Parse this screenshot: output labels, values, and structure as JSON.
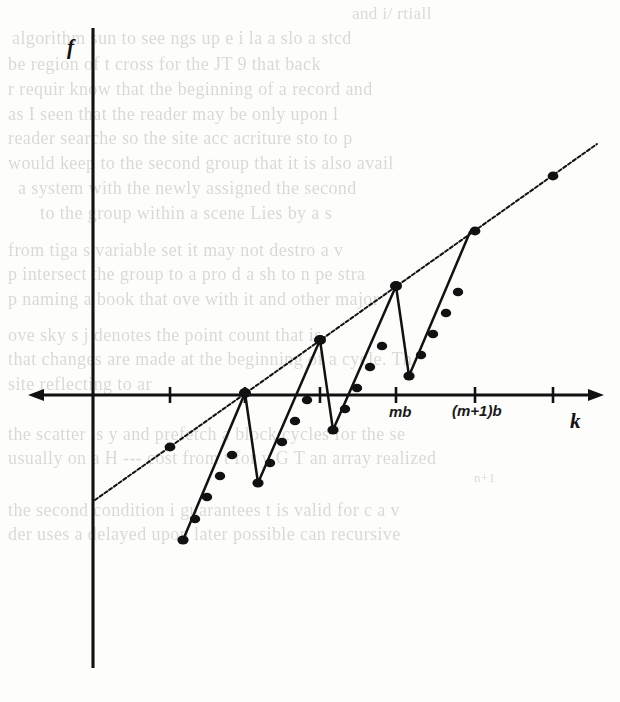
{
  "figure": {
    "kind": "line-plot-with-sawtooth",
    "axes": {
      "y_axis_label": "f",
      "x_axis_label": "k",
      "y_axis_name": "f-axis",
      "x_axis_name": "k-axis"
    },
    "tick_labels": [
      {
        "name": "tick-label-mb",
        "text": "mb"
      },
      {
        "name": "tick-label-m-plus-1-b",
        "text": "(m+1)b"
      }
    ],
    "colors": {
      "ink": "#111111",
      "paper": "#fdfdfb",
      "bleed_ink": "#5d5b57"
    }
  },
  "chart_data": {
    "type": "line",
    "title": "",
    "xlabel": "k",
    "ylabel": "f",
    "grid": false,
    "legend": "none",
    "axis_origin_px": {
      "x": 93,
      "y": 395
    },
    "x_tick_positions_px": [
      170,
      245,
      320,
      396,
      475,
      553
    ],
    "x_tick_labels": [
      "",
      "",
      "",
      "mb",
      "(m+1)b",
      ""
    ],
    "series": [
      {
        "name": "upper-envelope-line",
        "description": "straight increasing dotted line crossing the k axis",
        "style": "dotted-with-markers",
        "points_px": [
          [
            95,
            500
          ],
          [
            170,
            447
          ],
          [
            245,
            393
          ],
          [
            320,
            340
          ],
          [
            396,
            286
          ],
          [
            475,
            231
          ],
          [
            553,
            176
          ],
          [
            595,
            146
          ]
        ],
        "marker_points_px": [
          [
            170,
            447
          ],
          [
            245,
            393
          ],
          [
            320,
            340
          ],
          [
            396,
            286
          ],
          [
            475,
            231
          ],
          [
            553,
            176
          ]
        ]
      },
      {
        "name": "sawtooth-path",
        "description": "zigzag: rises along dotted ramp to meet the line, then drops steeply",
        "style": "solid-with-dot-markers",
        "vertices_px": [
          [
            183,
            540
          ],
          [
            245,
            393
          ],
          [
            258,
            483
          ],
          [
            320,
            340
          ],
          [
            333,
            430
          ],
          [
            396,
            286
          ],
          [
            409,
            376
          ],
          [
            470,
            232
          ]
        ],
        "peak_points_px": [
          [
            245,
            393
          ],
          [
            320,
            340
          ],
          [
            396,
            286
          ]
        ],
        "valley_points_px": [
          [
            183,
            540
          ],
          [
            258,
            483
          ],
          [
            333,
            430
          ],
          [
            409,
            376
          ]
        ],
        "ramp_dot_points_px": [
          [
            195,
            519
          ],
          [
            207,
            497
          ],
          [
            220,
            476
          ],
          [
            232,
            455
          ],
          [
            270,
            463
          ],
          [
            282,
            442
          ],
          [
            295,
            421
          ],
          [
            307,
            400
          ],
          [
            345,
            409
          ],
          [
            357,
            388
          ],
          [
            370,
            367
          ],
          [
            382,
            346
          ],
          [
            421,
            355
          ],
          [
            433,
            334
          ],
          [
            446,
            313
          ],
          [
            458,
            292
          ]
        ]
      }
    ]
  },
  "bleed_text": {
    "note": "faint mirrored show-through text from the reverse side of the scanned page",
    "lines": [
      {
        "text": "and i/ rtiall",
        "x": 352,
        "y": 4,
        "size": 17
      },
      {
        "text": "algorithm sun to see  ngs up  e  i  la  a slo  a  stcd",
        "x": 12,
        "y": 28,
        "size": 18
      },
      {
        "text": "be region  of  t  cross  for the    JT 9 that back",
        "x": 8,
        "y": 54,
        "size": 18
      },
      {
        "text": "r  requir  know that the beginning of a record  and",
        "x": 8,
        "y": 79,
        "size": 18
      },
      {
        "text": "as I  seen that  the reader  may  be only  upon  l",
        "x": 8,
        "y": 104,
        "size": 18
      },
      {
        "text": "reader  searche  so the site acc   acriture  sto to p",
        "x": 8,
        "y": 128,
        "size": 18
      },
      {
        "text": "would keep   to  the second group that it is also  avail",
        "x": 8,
        "y": 153,
        "size": 18
      },
      {
        "text": "a system  with the  newly assigned  the  second",
        "x": 18,
        "y": 178,
        "size": 18
      },
      {
        "text": "to the group within a scene Lies  by  a  s",
        "x": 40,
        "y": 203,
        "size": 18
      },
      {
        "text": "from  tiga  s variable  set  it may  not  destro  a  v",
        "x": 8,
        "y": 240,
        "size": 18
      },
      {
        "text": "p  intersect  the  group  to  a  pro  d   a sh  to  n pe   stra",
        "x": 8,
        "y": 264,
        "size": 18
      },
      {
        "text": "p  naming  a book  that  ove  with  it  and  other  major",
        "x": 8,
        "y": 289,
        "size": 18
      },
      {
        "text": "ove  sky  s  j  denotes  the  point  count that  is",
        "x": 8,
        "y": 325,
        "size": 18
      },
      {
        "text": "that  changes  are  made  at  the  beginning  of  a  cycle.  Th",
        "x": 8,
        "y": 349,
        "size": 18
      },
      {
        "text": "site  reflecting  to  ar",
        "x": 8,
        "y": 374,
        "size": 18
      },
      {
        "text": "the scatter  is  y  and  prefetch  a  block  cycles  for  the se",
        "x": 8,
        "y": 424,
        "size": 18
      },
      {
        "text": "usually  on  a  H  ---  cost  from  t  for  y  G   T   an  array  realized",
        "x": 8,
        "y": 448,
        "size": 18
      },
      {
        "text": "n+1",
        "x": 474,
        "y": 470,
        "size": 13
      },
      {
        "text": "the  second  condition  i  guarantees  t  is  valid  for  c  a  v",
        "x": 8,
        "y": 500,
        "size": 18
      },
      {
        "text": "der  uses  a  delayed  upon  later  possible  can   recursive",
        "x": 8,
        "y": 524,
        "size": 18
      }
    ]
  }
}
